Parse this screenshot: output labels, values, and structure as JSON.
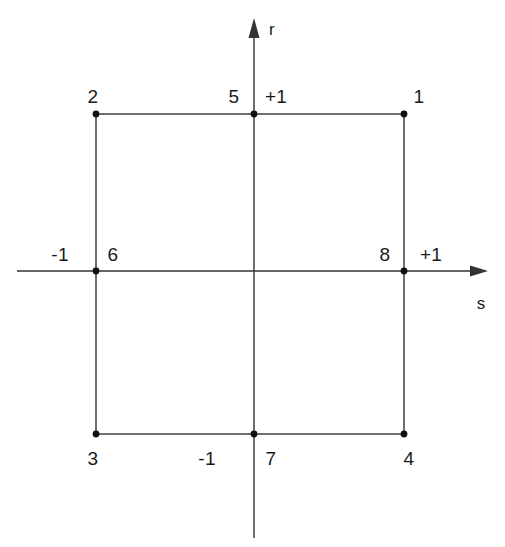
{
  "figure": {
    "kind": "natural-coordinate-element-diagram",
    "background_color": "#ffffff",
    "line_color": "#333333",
    "text_color": "#1b1b1b",
    "width": 505,
    "height": 547
  },
  "axes": {
    "vertical": {
      "label": "r",
      "label_x": 272,
      "label_y": 29,
      "x": 254,
      "y_top": 18,
      "y_bottom": 538,
      "arrow": "up"
    },
    "horizontal": {
      "label": "s",
      "label_x": 481,
      "label_y": 303,
      "y": 271,
      "x_left": 17,
      "x_right": 488,
      "arrow": "right"
    }
  },
  "element": {
    "square": {
      "left": 96,
      "right": 404,
      "top": 114,
      "bottom": 434
    },
    "nodes": [
      {
        "id": "1",
        "label": "1",
        "x": 404,
        "y": 114,
        "label_x": 419,
        "label_y": 96,
        "r": 1,
        "s": 1
      },
      {
        "id": "2",
        "label": "2",
        "x": 96,
        "y": 114,
        "label_x": 93,
        "label_y": 96,
        "r": 1,
        "s": -1
      },
      {
        "id": "3",
        "label": "3",
        "x": 96,
        "y": 434,
        "label_x": 93,
        "label_y": 458,
        "r": -1,
        "s": -1
      },
      {
        "id": "4",
        "label": "4",
        "x": 404,
        "y": 434,
        "label_x": 409,
        "label_y": 458,
        "r": -1,
        "s": 1
      },
      {
        "id": "5",
        "label": "5",
        "x": 254,
        "y": 114,
        "label_x": 234,
        "label_y": 96,
        "r": 1,
        "s": 0
      },
      {
        "id": "6",
        "label": "6",
        "x": 96,
        "y": 271,
        "label_x": 113,
        "label_y": 254,
        "r": 0,
        "s": -1
      },
      {
        "id": "7",
        "label": "7",
        "x": 254,
        "y": 434,
        "label_x": 271,
        "label_y": 458,
        "r": -1,
        "s": 0
      },
      {
        "id": "8",
        "label": "8",
        "x": 404,
        "y": 271,
        "label_x": 385,
        "label_y": 254,
        "r": 0,
        "s": 1
      }
    ]
  },
  "tick_labels": [
    {
      "id": "r-plus-one",
      "text": "+1",
      "x": 276,
      "y": 96,
      "axis": "r",
      "value": 1
    },
    {
      "id": "r-minus-one",
      "text": "-1",
      "x": 207,
      "y": 458,
      "axis": "r",
      "value": -1
    },
    {
      "id": "s-minus-one",
      "text": "-1",
      "x": 60,
      "y": 254,
      "axis": "s",
      "value": -1
    },
    {
      "id": "s-plus-one",
      "text": "+1",
      "x": 431,
      "y": 254,
      "axis": "s",
      "value": 1
    }
  ]
}
